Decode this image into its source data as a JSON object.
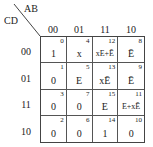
{
  "kmap": {
    "row_var": "CD",
    "col_var": "AB",
    "col_headers": [
      "00",
      "01",
      "11",
      "10"
    ],
    "row_headers": [
      "00",
      "01",
      "11",
      "10"
    ],
    "cells": [
      [
        {
          "idx": "0",
          "val": "1"
        },
        {
          "idx": "4",
          "val": "x"
        },
        {
          "idx": "12",
          "val": "xE+Ē"
        },
        {
          "idx": "8",
          "val": "Ē"
        }
      ],
      [
        {
          "idx": "1",
          "val": "0"
        },
        {
          "idx": "5",
          "val": "E"
        },
        {
          "idx": "13",
          "val": "xĒ"
        },
        {
          "idx": "9",
          "val": "Ē"
        }
      ],
      [
        {
          "idx": "3",
          "val": "0"
        },
        {
          "idx": "7",
          "val": "0"
        },
        {
          "idx": "15",
          "val": "E"
        },
        {
          "idx": "11",
          "val": "E+xĒ"
        }
      ],
      [
        {
          "idx": "2",
          "val": "0"
        },
        {
          "idx": "6",
          "val": "0"
        },
        {
          "idx": "14",
          "val": "1"
        },
        {
          "idx": "10",
          "val": "0"
        }
      ]
    ]
  }
}
